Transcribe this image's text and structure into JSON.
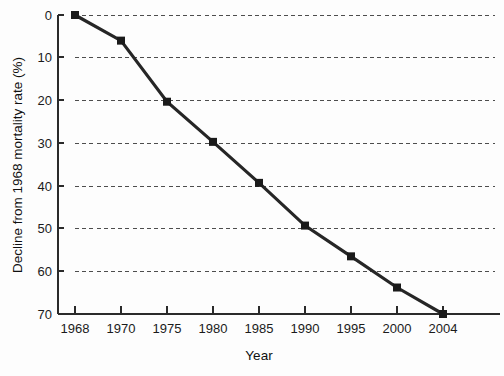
{
  "chart_data": {
    "type": "line",
    "title": "",
    "subtitle": "",
    "xlabel": "Year",
    "ylabel": "Decline from 1968 mortality rate (%)",
    "categories": [
      "1968",
      "1970",
      "1975",
      "1980",
      "1985",
      "1990",
      "1995",
      "2000",
      "2004"
    ],
    "x": [
      1968,
      1970,
      1975,
      1980,
      1985,
      1990,
      1995,
      2000,
      2004
    ],
    "values": [
      0,
      6,
      20.3,
      29.7,
      39.3,
      49.3,
      56.5,
      63.8,
      70
    ],
    "series": [
      {
        "name": "Decline from 1968 mortality rate",
        "values": [
          0,
          6,
          20.3,
          29.7,
          39.3,
          49.3,
          56.5,
          63.8,
          70
        ]
      }
    ],
    "ylim": [
      0,
      70
    ],
    "y_inverted": true,
    "yticks": [
      0,
      10,
      20,
      30,
      40,
      50,
      60,
      70
    ],
    "ytick_labels": [
      "0",
      "10",
      "20",
      "30",
      "40",
      "50",
      "60",
      "70"
    ],
    "xtick_labels": [
      "1968",
      "1970",
      "1975",
      "1980",
      "1985",
      "1990",
      "1995",
      "2000",
      "2004"
    ],
    "x_spacing": "categorical",
    "grid": true,
    "grid_axis": "y",
    "grid_style": "dashed",
    "legend": false,
    "legend_position": "none",
    "annotations": [],
    "colors": {
      "line": "#262626",
      "marker": "#1a1a1a",
      "grid": "#4d4d4d",
      "axis": "#2a2a2a",
      "text": "#1b1b1b",
      "background": "#fdfdfd"
    },
    "line_width": 3.2,
    "marker_shape": "square",
    "marker_size": 8
  }
}
